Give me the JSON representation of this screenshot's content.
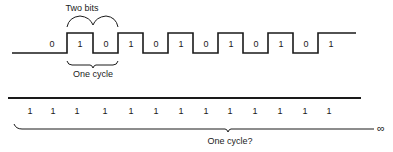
{
  "top_diagram": {
    "label_two_bits": "Two bits",
    "label_one_cycle": "One cycle",
    "bits": [
      {
        "value": "0",
        "x": 52
      },
      {
        "value": "1",
        "x": 80
      },
      {
        "value": "0",
        "x": 106
      },
      {
        "value": "1",
        "x": 131
      },
      {
        "value": "0",
        "x": 156
      },
      {
        "value": "1",
        "x": 181
      },
      {
        "value": "0",
        "x": 206
      },
      {
        "value": "1",
        "x": 231
      },
      {
        "value": "0",
        "x": 256
      },
      {
        "value": "1",
        "x": 281
      },
      {
        "value": "0",
        "x": 306
      },
      {
        "value": "1",
        "x": 331
      }
    ]
  },
  "bottom_diagram": {
    "label_one_cycle_question": "One cycle?",
    "infinity_symbol": "∞",
    "bits": [
      {
        "value": "1",
        "x": 30
      },
      {
        "value": "1",
        "x": 53
      },
      {
        "value": "1",
        "x": 77
      },
      {
        "value": "1",
        "x": 105
      },
      {
        "value": "1",
        "x": 131
      },
      {
        "value": "1",
        "x": 156
      },
      {
        "value": "1",
        "x": 181
      },
      {
        "value": "1",
        "x": 206
      },
      {
        "value": "1",
        "x": 230
      },
      {
        "value": "1",
        "x": 255
      },
      {
        "value": "1",
        "x": 280
      },
      {
        "value": "1",
        "x": 305
      },
      {
        "value": "1",
        "x": 329
      }
    ]
  },
  "colors": {
    "ink": "#1a1a1a",
    "background": "#ffffff"
  }
}
